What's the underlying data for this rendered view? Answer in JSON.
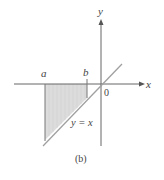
{
  "figure": {
    "caption": "(b)",
    "axes": {
      "x_label": "x",
      "y_label": "y",
      "origin_label": "0"
    },
    "bounds": {
      "left_label": "a",
      "right_label": "b"
    },
    "curve": {
      "label": "y = x",
      "equation": "y = x"
    },
    "shaded_region": "region between x = a and x = b, bounded above by x-axis and below by y = x",
    "colors": {
      "axis": "#666666",
      "line": "#9a9a9a",
      "shade": "#d9d9d9",
      "text": "#444444"
    }
  }
}
